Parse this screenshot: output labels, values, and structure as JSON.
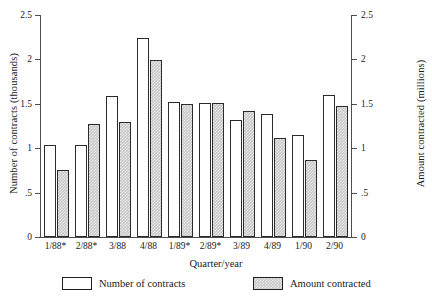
{
  "chart_data": {
    "type": "bar",
    "title": "",
    "xlabel": "Quarter/year",
    "ylabel": "Number of contracts (thousands)",
    "y2label": "Amount contracted (millions)",
    "categories": [
      "1/88*",
      "2/88*",
      "3/88",
      "4/88",
      "1/89*",
      "2/89*",
      "3/89",
      "4/89",
      "1/90",
      "2/90"
    ],
    "series": [
      {
        "name": "Number of contracts",
        "axis": "left",
        "color": "#ffffff",
        "values": [
          1.04,
          1.04,
          1.59,
          2.24,
          1.52,
          1.51,
          1.32,
          1.39,
          1.15,
          1.6
        ]
      },
      {
        "name": "Amount contracted",
        "axis": "right",
        "color": "#c9c9c9",
        "values": [
          0.75,
          1.27,
          1.3,
          1.99,
          1.5,
          1.51,
          1.42,
          1.11,
          0.87,
          1.47
        ]
      }
    ],
    "ylim": [
      0,
      2.5
    ],
    "y2lim": [
      0,
      2.5
    ],
    "yticks": [
      0,
      0.5,
      1,
      1.5,
      2,
      2.5
    ],
    "ytick_labels": [
      "0",
      ".5",
      "1",
      "1.5",
      "2",
      "2.5"
    ],
    "y2ticks": [
      0,
      0.5,
      1,
      1.5,
      2,
      2.5
    ],
    "y2tick_labels": [
      "0",
      ".5",
      "1",
      "1.5",
      "2",
      "2.5"
    ],
    "grid": false,
    "legend_position": "bottom"
  },
  "legend": {
    "entries": [
      {
        "label": "Number of contracts",
        "style": "white"
      },
      {
        "label": "Amount contracted",
        "style": "gray"
      }
    ]
  }
}
